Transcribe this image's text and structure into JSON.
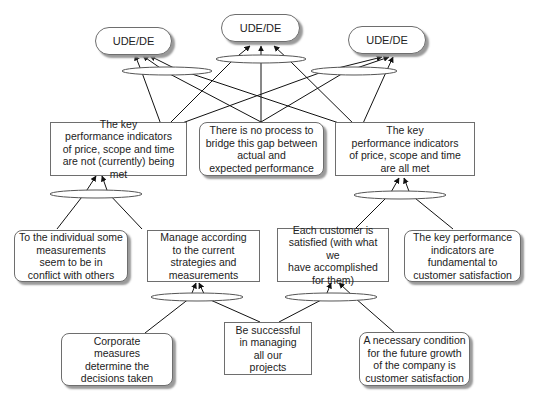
{
  "diagram": {
    "type": "current reality tree / logic tree",
    "colors": {
      "line": "#111111",
      "border": "#6e6e6e",
      "shadow": "#9a9a9a",
      "background": "#ffffff"
    },
    "nodes": {
      "ude_left": "UDE/DE",
      "ude_center": "UDE/DE",
      "ude_right": "UDE/DE",
      "kpi_not_met": "The key\nperformance indicators\nof price, scope and time\nare not (currently) being met",
      "no_process": "There is no process to\nbridge this gap between\nactual and\nexpected performance",
      "kpi_all_met": "The key\nperformance indicators\nof price, scope and time\nare all met",
      "individual_conflict": "To the individual some\nmeasurements\nseem to be in\nconflict with others",
      "manage_current": "Manage according\nto the current\nstrategies and\nmeasurements",
      "customer_satisfied": "Each customer is\nsatisfied (with what we\nhave accomplished\nfor them)",
      "kpi_fundamental": "The key performance\nindicators are\nfundamental to\ncustomer satisfaction",
      "corporate_measures": "Corporate\nmeasures\ndetermine the\ndecisions taken",
      "be_successful": "Be successful\nin managing\nall our\nprojects",
      "necessary_condition": "A necessary condition\nfor the future growth\nof the company is\ncustomer satisfaction"
    }
  }
}
